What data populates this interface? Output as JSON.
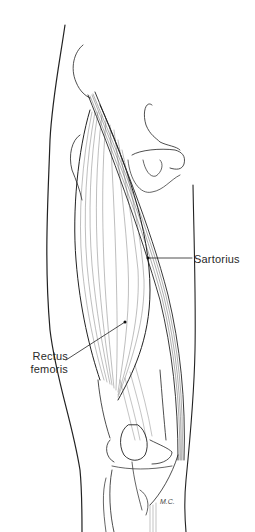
{
  "figure": {
    "stroke_color": "#222222",
    "background": "#ffffff"
  },
  "labels": {
    "sartorius": "Sartorius",
    "rectus_femoris_line1": "Rectus",
    "rectus_femoris_line2": "femoris"
  },
  "signature": "M.C."
}
